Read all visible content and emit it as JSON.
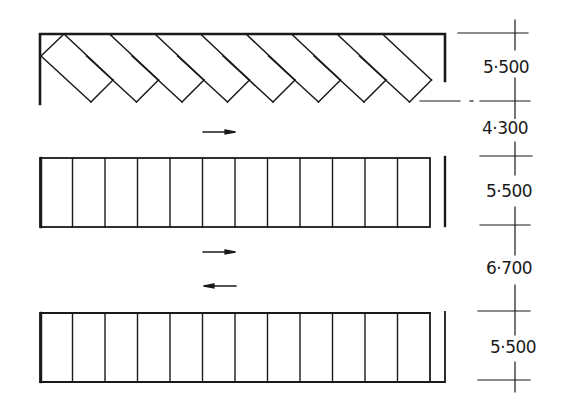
{
  "diagram": {
    "type": "parking-layout",
    "rows": [
      {
        "name": "angled-stalls-row",
        "stall_count": 8,
        "angle_deg": 45,
        "depth_label": "5·500"
      },
      {
        "name": "perpendicular-stalls-row-middle",
        "stall_count": 12,
        "depth_label": "5·500"
      },
      {
        "name": "perpendicular-stalls-row-bottom",
        "stall_count": 12,
        "depth_label": "5·500"
      }
    ],
    "aisles": [
      {
        "name": "one-way-aisle",
        "width_label": "4·300",
        "arrows": [
          "right"
        ]
      },
      {
        "name": "two-way-aisle",
        "width_label": "6·700",
        "arrows": [
          "right",
          "left"
        ]
      }
    ],
    "dimensions": [
      "5·500",
      "4·300",
      "5·500",
      "6·700",
      "5·500"
    ],
    "colors": {
      "line": "#1a1a1a",
      "background": "#ffffff"
    }
  }
}
